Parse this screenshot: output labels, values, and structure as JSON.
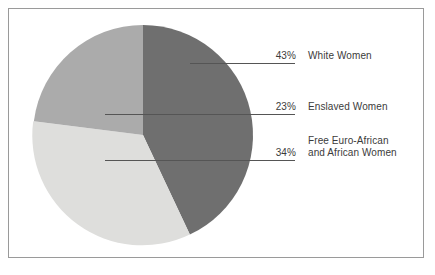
{
  "chart_data": {
    "type": "pie",
    "title": "",
    "subtitle": "",
    "xlabel": "",
    "ylabel": "",
    "legend_position": "right-callouts",
    "grid": false,
    "categories": [
      "White Women",
      "Enslaved Women",
      "Free Euro-African and African Women"
    ],
    "values": [
      43,
      23,
      34
    ],
    "value_labels": [
      "43%",
      "23%",
      "34%"
    ],
    "units": "percent",
    "total": 100,
    "start_angle_deg": 0,
    "direction": "clockwise",
    "slices": [
      {
        "label": "White Women",
        "value": 43,
        "value_label": "43%",
        "color": "#6f6f6f",
        "start_angle_deg": 0,
        "end_angle_deg": 154.8
      },
      {
        "label": "Free Euro-African and African Women",
        "label_line1": "Free Euro-African",
        "label_line2": "and African Women",
        "value": 34,
        "value_label": "34%",
        "color": "#dededc",
        "start_angle_deg": 154.8,
        "end_angle_deg": 277.2
      },
      {
        "label": "Enslaved Women",
        "value": 23,
        "value_label": "23%",
        "color": "#ababab",
        "start_angle_deg": 277.2,
        "end_angle_deg": 360
      }
    ]
  },
  "callouts": [
    {
      "name": "white-women",
      "value_label": "43%",
      "label_line1": "White Women",
      "label_line2": ""
    },
    {
      "name": "enslaved-women",
      "value_label": "23%",
      "label_line1": "Enslaved Women",
      "label_line2": ""
    },
    {
      "name": "free-euro-african-women",
      "value_label": "34%",
      "label_line1": "Free Euro-African",
      "label_line2": "and African Women"
    }
  ],
  "style": {
    "background": "#ffffff",
    "frame_color": "#9a9a9a",
    "text_color": "#3b3b3b",
    "leader_line_color": "#555555",
    "slice_dark": "#6f6f6f",
    "slice_medium": "#ababab",
    "slice_light": "#dededc"
  }
}
